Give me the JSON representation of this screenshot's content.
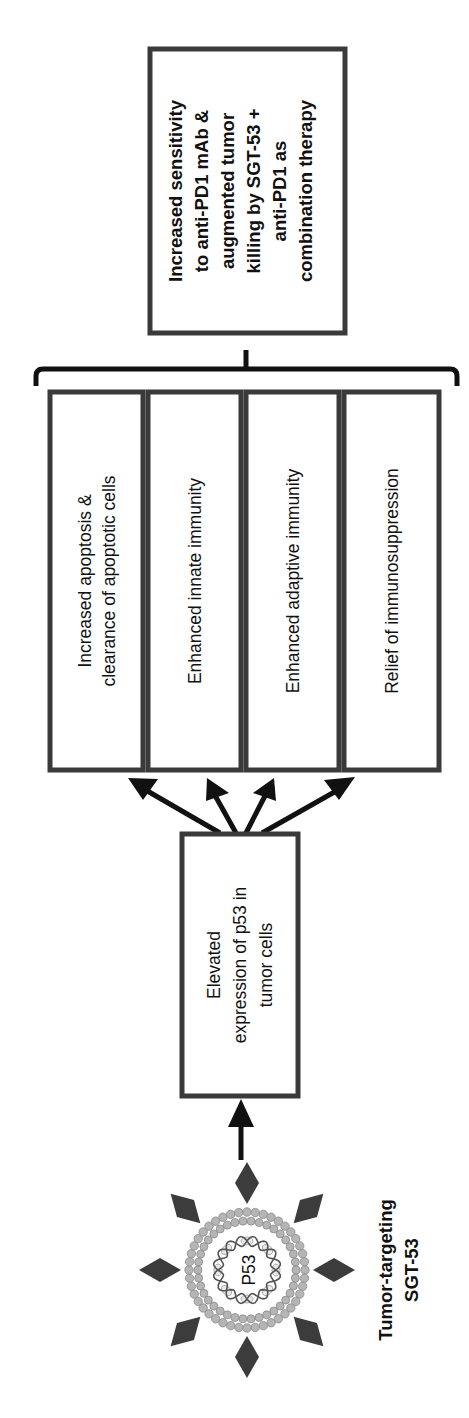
{
  "diagram": {
    "orientation": "rotated-90-ccw",
    "source_node": {
      "label_line1": "Tumor-targeting",
      "label_line2": "SGT-53",
      "particle_label": "P53"
    },
    "step1": {
      "lines": [
        "Elevated",
        "expression of p53 in",
        "tumor cells"
      ]
    },
    "effects": [
      {
        "lines": [
          "Increased apoptosis &",
          "clearance of apoptotic cells"
        ]
      },
      {
        "lines": [
          "Enhanced innate immunity"
        ]
      },
      {
        "lines": [
          "Enhanced adaptive immunity"
        ]
      },
      {
        "lines": [
          "Relief of immunosuppression"
        ]
      }
    ],
    "outcome": {
      "lines": [
        "Increased sensitivity",
        "to anti-PD1 mAb &",
        "augmented tumor",
        "killing by SGT-53 +",
        "anti-PD1 as",
        "combination therapy"
      ]
    },
    "colors": {
      "box_border": "#3a3a3a",
      "arrow": "#111111",
      "diamond": "#3c3c3c",
      "bead": "#b5b5b5"
    }
  }
}
